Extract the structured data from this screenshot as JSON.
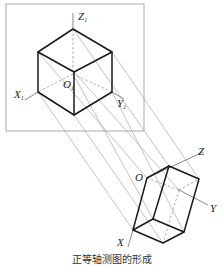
{
  "figure": {
    "caption": "正等轴测图的形成",
    "upper_cube": {
      "axes": {
        "z": {
          "letter": "Z",
          "sub": "1"
        },
        "x": {
          "letter": "X",
          "sub": "1"
        },
        "y": {
          "letter": "Y",
          "sub": "1"
        },
        "origin": {
          "letter": "O",
          "sub": "1"
        }
      }
    },
    "lower_projection": {
      "axes": {
        "z": {
          "letter": "Z"
        },
        "x": {
          "letter": "X"
        },
        "y": {
          "letter": "Y"
        },
        "origin": {
          "letter": "O"
        }
      }
    }
  }
}
